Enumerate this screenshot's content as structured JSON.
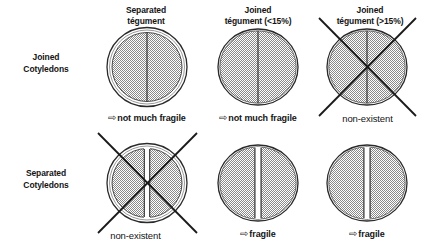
{
  "figure": {
    "colors": {
      "fill": "#bdbdbd",
      "stroke": "#1a1a1a",
      "text": "#141414",
      "background": "#ffffff"
    },
    "columns": [
      {
        "line1": "Separated",
        "line2": "tégument"
      },
      {
        "line1": "Joined",
        "line2": "tégument (<15%)"
      },
      {
        "line1": "Joined",
        "line2": "tégument (>15%)"
      }
    ],
    "rows": [
      {
        "line1": "Joined",
        "line2": "Cotyledons"
      },
      {
        "line1": "Separated",
        "line2": "Cotyledons"
      }
    ],
    "cells": [
      {
        "id": "r0c0",
        "row": "Joined Cotyledons",
        "column": "Separated tégument",
        "tegument": "separated",
        "cotyledons": "joined",
        "crossed_out": false,
        "arrow": "⇨",
        "caption": "not much fragile",
        "caption_style": "emph"
      },
      {
        "id": "r0c1",
        "row": "Joined Cotyledons",
        "column": "Joined tégument (<15%)",
        "tegument": "joined",
        "cotyledons": "joined",
        "crossed_out": false,
        "arrow": "⇨",
        "caption": "not much fragile",
        "caption_style": "emph"
      },
      {
        "id": "r0c2",
        "row": "Joined Cotyledons",
        "column": "Joined tégument (>15%)",
        "tegument": "joined",
        "cotyledons": "joined",
        "crossed_out": true,
        "arrow": "",
        "caption": "non-existent",
        "caption_style": "plain"
      },
      {
        "id": "r1c0",
        "row": "Separated Cotyledons",
        "column": "Separated tégument",
        "tegument": "separated",
        "cotyledons": "separated",
        "crossed_out": true,
        "arrow": "",
        "caption": "non-existent",
        "caption_style": "plain"
      },
      {
        "id": "r1c1",
        "row": "Separated Cotyledons",
        "column": "Joined tégument (<15%)",
        "tegument": "joined",
        "cotyledons": "separated",
        "crossed_out": false,
        "arrow": "⇨",
        "caption": "fragile",
        "caption_style": "emph"
      },
      {
        "id": "r1c2",
        "row": "Separated Cotyledons",
        "column": "Joined tégument (>15%)",
        "tegument": "joined",
        "cotyledons": "separated",
        "crossed_out": false,
        "arrow": "⇨",
        "caption": "fragile",
        "caption_style": "emph"
      }
    ]
  }
}
